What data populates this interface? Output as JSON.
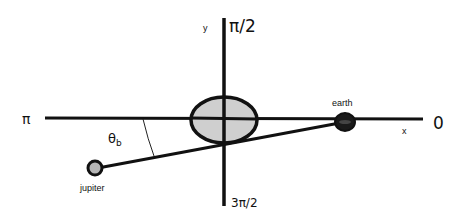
{
  "diagram": {
    "colors": {
      "stroke": "#111111",
      "sun_fill": "#cfcfcf",
      "earth_fill": "#1a1a1a",
      "jupiter_fill": "#b5b5b5",
      "background": "#ffffff"
    },
    "axes": {
      "x_label": "x",
      "y_label": "y",
      "angle_0_label": "0",
      "angle_pi_half_label": "π/2",
      "angle_pi_label": "π",
      "angle_3pi_half_label": "3π/2"
    },
    "bodies": {
      "sun_label": "",
      "earth_label": "earth",
      "jupiter_label": "jupiter"
    },
    "angle": {
      "symbol": "θ",
      "subscript": "b"
    }
  }
}
